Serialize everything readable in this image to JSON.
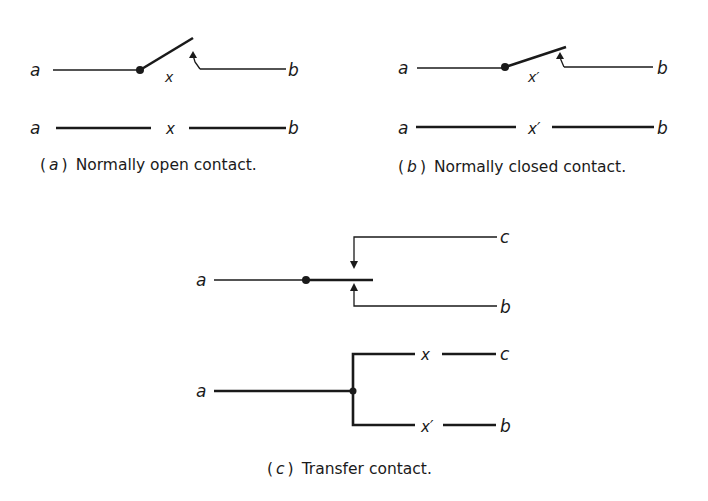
{
  "figure": {
    "panel_a": {
      "caption_letter": "a",
      "caption_text": "Normally open contact.",
      "top": {
        "left_terminal": "a",
        "right_terminal": "b",
        "contact_label": "x"
      },
      "bottom": {
        "left_terminal": "a",
        "right_terminal": "b",
        "contact_label": "x"
      }
    },
    "panel_b": {
      "caption_letter": "b",
      "caption_text": "Normally closed contact.",
      "top": {
        "left_terminal": "a",
        "right_terminal": "b",
        "contact_label": "x′"
      },
      "bottom": {
        "left_terminal": "a",
        "right_terminal": "b",
        "contact_label": "x′"
      }
    },
    "panel_c": {
      "caption_letter": "c",
      "caption_text": "Transfer contact.",
      "top": {
        "left_terminal": "a",
        "upper_terminal": "c",
        "lower_terminal": "b"
      },
      "bottom": {
        "left_terminal": "a",
        "upper_contact_label": "x",
        "upper_terminal": "c",
        "lower_contact_label": "x′",
        "lower_terminal": "b"
      }
    }
  }
}
